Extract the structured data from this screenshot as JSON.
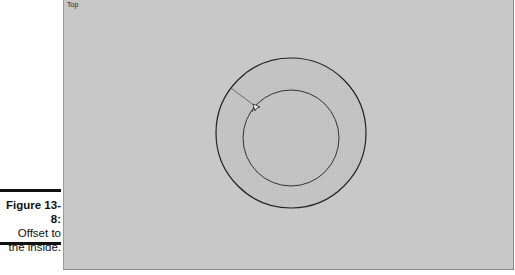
{
  "viewport": {
    "label": "Top",
    "background": "#c8c8c8"
  },
  "scene": {
    "outer_circle": {
      "cx": 227,
      "cy": 133,
      "r": 75,
      "fill": "#c0c0c0",
      "stroke": "#222222"
    },
    "inner_circle": {
      "cx": 227,
      "cy": 138,
      "r": 48,
      "stroke": "#333333"
    },
    "offset_line": {
      "x1": 167,
      "y1": 88,
      "x2": 190,
      "y2": 106
    },
    "cursor": "offset-cursor"
  },
  "caption": {
    "figure": "Figure 13-8:",
    "line1": "Offset to",
    "line2": "the inside."
  }
}
